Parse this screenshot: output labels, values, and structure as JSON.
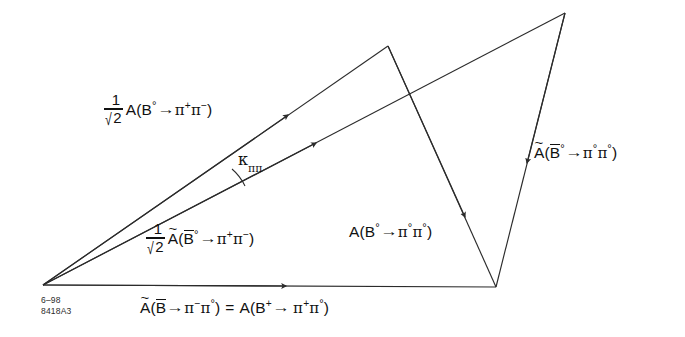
{
  "figure": {
    "stroke_color": "#2b2b2b",
    "text_color": "#111111",
    "background": "#ffffff"
  },
  "labels": {
    "amp_b0_pipi": {
      "fraction_numerator": "1",
      "fraction_denominator": "2",
      "radical": "√",
      "amplitude": "A",
      "open_paren": "(",
      "meson": "B",
      "meson_charge": "°",
      "arrow": "→",
      "pi1": "π",
      "pi1_charge": "+",
      "pi2": "π",
      "pi2_charge": "−",
      "close_paren": ")"
    },
    "amp_b0bar_pipi": {
      "fraction_numerator": "1",
      "fraction_denominator": "2",
      "radical": "√",
      "amplitude": "A",
      "tilde": "~",
      "open_paren": "(",
      "meson": "B",
      "meson_charge": "°",
      "arrow": "→",
      "pi1": "π",
      "pi1_charge": "+",
      "pi2": "π",
      "pi2_charge": "−",
      "close_paren": ")"
    },
    "amp_b0_pi0pi0": {
      "amplitude": "A",
      "open_paren": "(",
      "meson": "B",
      "meson_charge": "°",
      "arrow": "→",
      "pi1": "π",
      "pi1_charge": "°",
      "pi2": "π",
      "pi2_charge": "°",
      "close_paren": ")"
    },
    "amp_b0bar_pi0pi0": {
      "amplitude": "A",
      "tilde": "~",
      "open_paren": "(",
      "meson": "B",
      "meson_charge": "°",
      "arrow": "→",
      "pi1": "π",
      "pi1_charge": "°",
      "pi2": "π",
      "pi2_charge": "°",
      "close_paren": ")"
    },
    "base_equation": {
      "lhs_amplitude": "A",
      "lhs_tilde": "~",
      "lhs_open_paren": "(",
      "lhs_meson": "B",
      "lhs_arrow": "→",
      "lhs_pi1": "π",
      "lhs_pi1_charge": "−",
      "lhs_pi2": "π",
      "lhs_pi2_charge": "°",
      "lhs_close_paren": ")",
      "equals": "=",
      "rhs_amplitude": "A",
      "rhs_open_paren": "(",
      "rhs_meson": "B",
      "rhs_meson_charge": "+",
      "rhs_arrow": "→",
      "rhs_pi1": "π",
      "rhs_pi1_charge": "+",
      "rhs_pi2": "π",
      "rhs_pi2_charge": "°",
      "rhs_close_paren": ")"
    },
    "angle": {
      "symbol": "κ",
      "subscript": "ππ"
    }
  },
  "stamp": {
    "date_code": "6–98",
    "figure_id": "8418A3"
  },
  "geometry": {
    "origin": [
      43,
      285
    ],
    "upper_apex": [
      388,
      46
    ],
    "top_right_apex": [
      565,
      13
    ],
    "bottom_right": [
      496,
      287
    ],
    "segments": [
      {
        "name": "ray-b0-pipi",
        "from": [
          43,
          285
        ],
        "to": [
          388,
          46
        ],
        "arrow_at": [
          285,
          118
        ]
      },
      {
        "name": "ray-b0bar-pipi",
        "from": [
          43,
          285
        ],
        "to": [
          565,
          13
        ],
        "arrow_at": [
          312,
          148
        ]
      },
      {
        "name": "baseline",
        "from": [
          43,
          285
        ],
        "to": [
          496,
          287
        ],
        "arrow_at": [
          283,
          286
        ]
      },
      {
        "name": "edge-b0-pi0pi0",
        "from": [
          388,
          46
        ],
        "to": [
          496,
          287
        ],
        "arrow_at": [
          461,
          208
        ]
      },
      {
        "name": "edge-b0bar-pi0pi0",
        "from": [
          565,
          13
        ],
        "to": [
          496,
          287
        ],
        "arrow_at": [
          524,
          155
        ]
      }
    ]
  }
}
